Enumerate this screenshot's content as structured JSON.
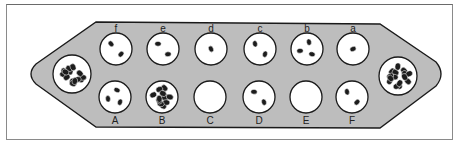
{
  "diagram": {
    "type": "mancala-board",
    "colors": {
      "board": "#bdbdbd",
      "board_stroke": "#1a1a1a",
      "pit": "#ffffff",
      "seed": "#1c1c1c",
      "frame": "#8a8a8a"
    },
    "stores": [
      {
        "id": "left-store",
        "seeds": 14,
        "cx": 72,
        "cy": 74
      },
      {
        "id": "right-store",
        "seeds": 15,
        "cx": 398,
        "cy": 76
      }
    ],
    "top_row": [
      {
        "label": "f",
        "seeds": 2,
        "cx": 116
      },
      {
        "label": "e",
        "seeds": 2,
        "cx": 163
      },
      {
        "label": "d",
        "seeds": 1,
        "cx": 211
      },
      {
        "label": "c",
        "seeds": 2,
        "cx": 260
      },
      {
        "label": "b",
        "seeds": 3,
        "cx": 307
      },
      {
        "label": "a",
        "seeds": 1,
        "cx": 353
      }
    ],
    "bottom_row": [
      {
        "label": "A",
        "seeds": 3,
        "cx": 115
      },
      {
        "label": "B",
        "seeds": 12,
        "cx": 162
      },
      {
        "label": "C",
        "seeds": 0,
        "cx": 210
      },
      {
        "label": "D",
        "seeds": 2,
        "cx": 259
      },
      {
        "label": "E",
        "seeds": 0,
        "cx": 306
      },
      {
        "label": "F",
        "seeds": 2,
        "cx": 352
      }
    ]
  }
}
